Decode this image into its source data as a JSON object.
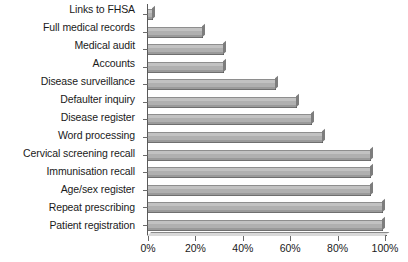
{
  "chart_data": {
    "type": "bar",
    "orientation": "horizontal",
    "title": "",
    "xlabel": "",
    "ylabel": "",
    "xlim": [
      0,
      100
    ],
    "xticks": [
      "0%",
      "20%",
      "40%",
      "60%",
      "80%",
      "100%"
    ],
    "xtick_values": [
      0,
      20,
      40,
      60,
      80,
      100
    ],
    "grid": false,
    "legend": null,
    "categories": [
      "Links to FHSA",
      "Full medical records",
      "Medical audit",
      "Accounts",
      "Disease surveillance",
      "Defaulter inquiry",
      "Disease register",
      "Word processing",
      "Cervical screening recall",
      "Immunisation recall",
      "Age/sex register",
      "Repeat prescribing",
      "Patient registration"
    ],
    "values": [
      2,
      23,
      32,
      32,
      54,
      63,
      69,
      74,
      94,
      94,
      94,
      99,
      99
    ],
    "bar_fill_color": "#b8b8b8",
    "bar_edge_color": "#5a5a5a",
    "axis_color": "#5a5a5a",
    "background_color": "#ffffff"
  }
}
